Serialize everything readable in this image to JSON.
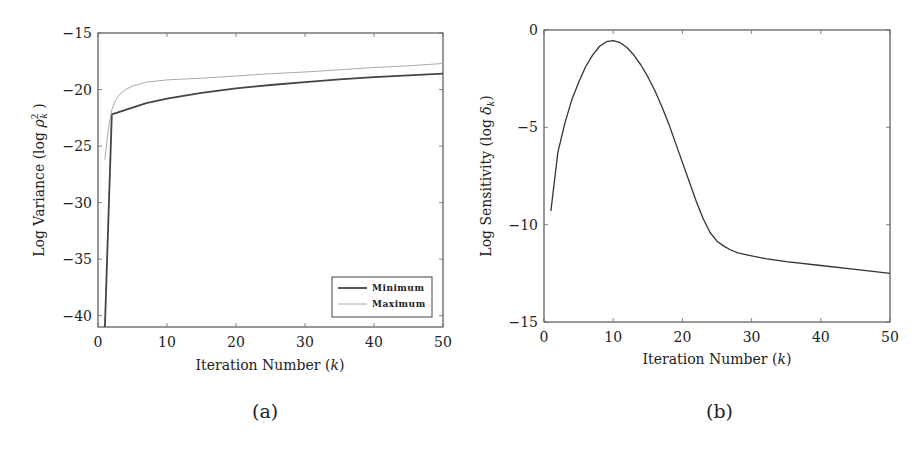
{
  "chart_data": [
    {
      "id": "a",
      "type": "line",
      "caption": "(a)",
      "title": "",
      "xlabel": "Iteration Number (k)",
      "ylabel": "Log Variance (log ρ_k²)",
      "xlim": [
        0,
        50
      ],
      "ylim": [
        -41,
        -15
      ],
      "xticks": [
        0,
        10,
        20,
        30,
        40,
        50
      ],
      "yticks": [
        -15,
        -20,
        -25,
        -30,
        -35,
        -40
      ],
      "grid": false,
      "legend_position": "lower right",
      "series": [
        {
          "name": "Minimum",
          "color": "#444444",
          "width": 1.8,
          "x": [
            1,
            2,
            3,
            5,
            7,
            10,
            15,
            20,
            25,
            30,
            35,
            40,
            45,
            50
          ],
          "y": [
            -41,
            -22.2,
            -22.0,
            -21.6,
            -21.2,
            -20.8,
            -20.3,
            -19.9,
            -19.6,
            -19.35,
            -19.1,
            -18.9,
            -18.75,
            -18.6
          ]
        },
        {
          "name": "Maximum",
          "color": "#aaaaaa",
          "width": 1.0,
          "x": [
            1,
            1.5,
            2,
            2.5,
            3,
            4,
            5,
            7,
            10,
            15,
            20,
            25,
            30,
            35,
            40,
            45,
            50
          ],
          "y": [
            -26.2,
            -23.5,
            -21.8,
            -21.0,
            -20.5,
            -20.0,
            -19.7,
            -19.35,
            -19.15,
            -19.0,
            -18.8,
            -18.6,
            -18.45,
            -18.25,
            -18.05,
            -17.9,
            -17.7
          ]
        }
      ]
    },
    {
      "id": "b",
      "type": "line",
      "caption": "(b)",
      "title": "",
      "xlabel": "Iteration Number (k)",
      "ylabel": "Log Sensitivity (log δ_k)",
      "xlim": [
        0,
        50
      ],
      "ylim": [
        -15,
        0
      ],
      "xticks": [
        0,
        10,
        20,
        30,
        40,
        50
      ],
      "yticks": [
        0,
        -5,
        -10,
        -15
      ],
      "grid": false,
      "series": [
        {
          "name": "Sensitivity",
          "color": "#333333",
          "width": 1.3,
          "x": [
            1,
            2,
            3,
            4,
            5,
            6,
            7,
            8,
            9,
            10,
            11,
            12,
            13,
            14,
            15,
            16,
            17,
            18,
            19,
            20,
            21,
            22,
            23,
            24,
            25,
            26,
            27,
            28,
            30,
            32,
            35,
            40,
            45,
            50
          ],
          "y": [
            -9.3,
            -6.3,
            -4.8,
            -3.6,
            -2.7,
            -1.9,
            -1.3,
            -0.85,
            -0.6,
            -0.55,
            -0.65,
            -0.9,
            -1.3,
            -1.8,
            -2.4,
            -3.1,
            -3.9,
            -4.8,
            -5.8,
            -6.8,
            -7.8,
            -8.8,
            -9.7,
            -10.4,
            -10.85,
            -11.1,
            -11.3,
            -11.45,
            -11.6,
            -11.75,
            -11.9,
            -12.1,
            -12.3,
            -12.5
          ]
        }
      ]
    }
  ],
  "captions": {
    "a": "(a)",
    "b": "(b)"
  },
  "labels": {
    "a_xlabel": "Iteration Number (",
    "a_ylabel": "Log Variance (log ",
    "b_xlabel": "Iteration Number (",
    "b_ylabel": "Log Sensitivity (log ",
    "k": "k",
    "close": ")",
    "legend_min": "Minimum",
    "legend_max": "Maximum"
  }
}
